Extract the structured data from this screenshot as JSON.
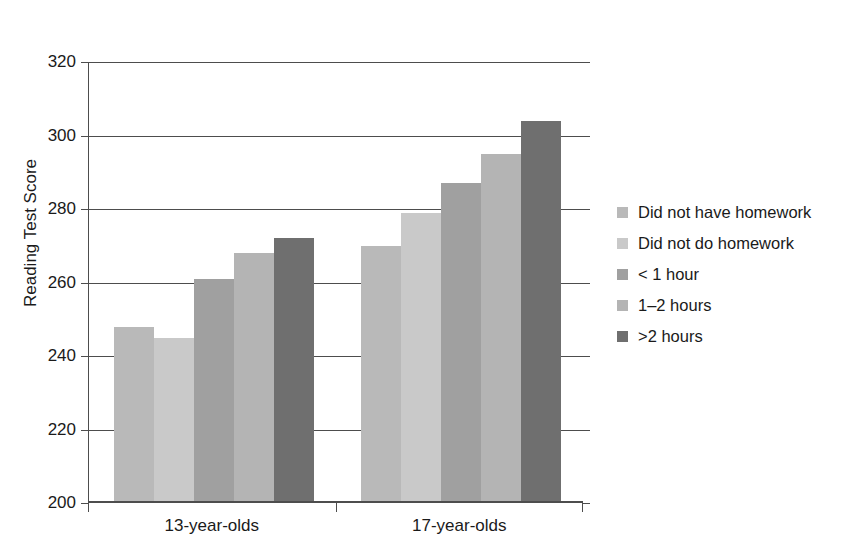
{
  "title": {
    "line1": "",
    "line2": "of Homework"
  },
  "axes": {
    "y_title": "Reading Test Score",
    "y_ticks": [
      "320",
      "300",
      "280",
      "260",
      "240",
      "220",
      "200"
    ],
    "x_categories": [
      "13-year-olds",
      "17-year-olds"
    ]
  },
  "legend": {
    "items": [
      {
        "label": "Did not have homework",
        "color": "#b9b9b9"
      },
      {
        "label": "Did not do homework",
        "color": "#c9c9c9"
      },
      {
        "label": "< 1 hour",
        "color": "#a0a0a0"
      },
      {
        "label": "1–2 hours",
        "color": "#b4b4b4"
      },
      {
        "label": ">2 hours",
        "color": "#6f6f6f"
      }
    ]
  },
  "chart_data": {
    "type": "bar",
    "xlabel": "",
    "ylabel": "Reading Test Score",
    "ylim": [
      200,
      320
    ],
    "ytick_step": 20,
    "grid": true,
    "legend_position": "right",
    "categories": [
      "13-year-olds",
      "17-year-olds"
    ],
    "series": [
      {
        "name": "Did not have homework",
        "color": "#b9b9b9",
        "values": [
          248,
          270
        ]
      },
      {
        "name": "Did not do homework",
        "color": "#c9c9c9",
        "values": [
          245,
          279
        ]
      },
      {
        "name": "< 1 hour",
        "color": "#a0a0a0",
        "values": [
          261,
          287
        ]
      },
      {
        "name": "1–2 hours",
        "color": "#b4b4b4",
        "values": [
          268,
          295
        ]
      },
      {
        "name": ">2 hours",
        "color": "#6f6f6f",
        "values": [
          272,
          304
        ]
      }
    ]
  }
}
